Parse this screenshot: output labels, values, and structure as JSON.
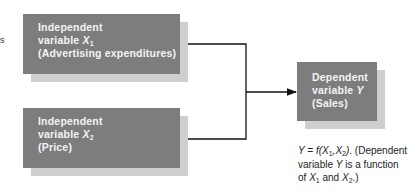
{
  "diagram": {
    "type": "flow",
    "edge_fragment": "s",
    "independent_1": {
      "line1": "Independent",
      "line2_prefix": "variable ",
      "var": "X",
      "sub": "1",
      "line3": "(Advertising expenditures)"
    },
    "independent_2": {
      "line1": "Independent",
      "line2_prefix": "variable ",
      "var": "X",
      "sub": "2",
      "line3": "(Price)"
    },
    "dependent": {
      "line1": "Dependent",
      "line2_prefix": "variable ",
      "var": "Y",
      "line3": "(Sales)"
    },
    "caption": {
      "y": "Y",
      "eq": " = f(",
      "x": "X",
      "s1": "1",
      "comma": ",",
      "x2": "X",
      "s2": "2",
      "close": ")",
      "rest1": ". (Dependent",
      "l2a": "variable ",
      "l2y": "Y",
      "l2b": " is a function",
      "l3a": "of ",
      "l3x1": "X",
      "l3s1": "1",
      "l3and": " and ",
      "l3x2": "X",
      "l3s2": "2",
      "l3end": ".)"
    },
    "colors": {
      "box": "#7d7d7d",
      "shadow": "#cfcfcf",
      "box_text": "#f4f4f4",
      "line": "#111111"
    }
  }
}
